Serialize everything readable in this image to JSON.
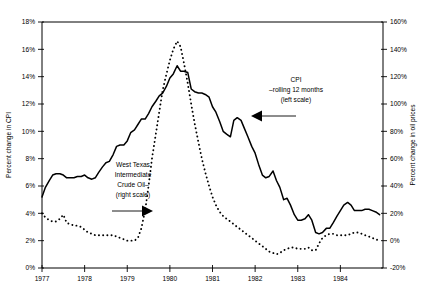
{
  "chart_data": {
    "type": "line",
    "title": "",
    "subtitle": "",
    "xlabel": "",
    "ylabel": "Percent change in CPI",
    "y2label": "Percent change in oil prices",
    "grid": false,
    "legend_position": "inline-annotations",
    "xlim": [
      1977,
      1985
    ],
    "x_tick_labels": [
      "1977",
      "1978",
      "1979",
      "1980",
      "1981",
      "1982",
      "1983",
      "1984"
    ],
    "x_ticks": [
      1977,
      1978,
      1979,
      1980,
      1981,
      1982,
      1983,
      1984
    ],
    "ylim": [
      0,
      18
    ],
    "y_tick_labels": [
      "0%",
      "2%",
      "4%",
      "6%",
      "8%",
      "10%",
      "12%",
      "14%",
      "16%",
      "18%"
    ],
    "y_ticks": [
      0,
      2,
      4,
      6,
      8,
      10,
      12,
      14,
      16,
      18
    ],
    "y2lim": [
      -20,
      160
    ],
    "y2_tick_labels": [
      "-20%",
      "0%",
      "20%",
      "40%",
      "60%",
      "80%",
      "100%",
      "120%",
      "140%",
      "160%"
    ],
    "y2_ticks": [
      -20,
      0,
      20,
      40,
      60,
      80,
      100,
      120,
      140,
      160
    ],
    "series": [
      {
        "name": "CPI - rolling 12 months",
        "axis": "left",
        "style": "solid",
        "x": [
          1977.0,
          1977.08,
          1977.17,
          1977.25,
          1977.33,
          1977.42,
          1977.5,
          1977.58,
          1977.67,
          1977.75,
          1977.83,
          1977.92,
          1978.0,
          1978.08,
          1978.17,
          1978.25,
          1978.33,
          1978.42,
          1978.5,
          1978.58,
          1978.67,
          1978.75,
          1978.83,
          1978.92,
          1979.0,
          1979.08,
          1979.17,
          1979.25,
          1979.33,
          1979.42,
          1979.5,
          1979.58,
          1979.67,
          1979.75,
          1979.83,
          1979.92,
          1980.0,
          1980.08,
          1980.17,
          1980.25,
          1980.33,
          1980.42,
          1980.5,
          1980.58,
          1980.67,
          1980.75,
          1980.83,
          1980.92,
          1981.0,
          1981.08,
          1981.17,
          1981.25,
          1981.33,
          1981.42,
          1981.5,
          1981.58,
          1981.67,
          1981.75,
          1981.83,
          1981.92,
          1982.0,
          1982.08,
          1982.17,
          1982.25,
          1982.33,
          1982.42,
          1982.5,
          1982.58,
          1982.67,
          1982.75,
          1982.83,
          1982.92,
          1983.0,
          1983.08,
          1983.17,
          1983.25,
          1983.33,
          1983.42,
          1983.5,
          1983.58,
          1983.67,
          1983.75,
          1983.83,
          1983.92,
          1984.0,
          1984.08,
          1984.17,
          1984.25,
          1984.33,
          1984.42,
          1984.5,
          1984.58,
          1984.67,
          1984.75,
          1984.83,
          1984.92
        ],
        "values": [
          5.2,
          5.9,
          6.4,
          6.8,
          6.9,
          6.9,
          6.8,
          6.6,
          6.6,
          6.6,
          6.7,
          6.7,
          6.8,
          6.6,
          6.5,
          6.6,
          7.0,
          7.4,
          7.7,
          7.8,
          8.3,
          8.9,
          9.0,
          9.0,
          9.3,
          9.9,
          10.1,
          10.5,
          10.9,
          10.9,
          11.3,
          11.8,
          12.2,
          12.6,
          12.8,
          13.3,
          13.9,
          14.2,
          14.8,
          14.4,
          14.4,
          14.3,
          13.1,
          12.9,
          12.8,
          12.8,
          12.7,
          12.5,
          11.8,
          11.4,
          10.7,
          10.0,
          9.8,
          9.6,
          10.8,
          11.0,
          10.8,
          10.2,
          9.6,
          8.9,
          8.4,
          7.6,
          6.8,
          6.6,
          6.7,
          7.1,
          6.4,
          5.9,
          5.0,
          5.1,
          4.6,
          3.9,
          3.5,
          3.5,
          3.6,
          3.9,
          3.5,
          2.6,
          2.5,
          2.6,
          2.9,
          2.9,
          3.3,
          3.8,
          4.2,
          4.6,
          4.8,
          4.6,
          4.2,
          4.2,
          4.2,
          4.3,
          4.3,
          4.2,
          4.1,
          3.9
        ]
      },
      {
        "name": "West Texas Intermediate Crude Oil",
        "axis": "right",
        "style": "dotted",
        "x": [
          1977.0,
          1977.08,
          1977.17,
          1977.25,
          1977.33,
          1977.42,
          1977.5,
          1977.58,
          1977.67,
          1977.75,
          1977.83,
          1977.92,
          1978.0,
          1978.08,
          1978.17,
          1978.25,
          1978.33,
          1978.42,
          1978.5,
          1978.58,
          1978.67,
          1978.75,
          1978.83,
          1978.92,
          1979.0,
          1979.08,
          1979.17,
          1979.25,
          1979.33,
          1979.42,
          1979.5,
          1979.58,
          1979.67,
          1979.75,
          1979.83,
          1979.92,
          1980.0,
          1980.08,
          1980.17,
          1980.25,
          1980.33,
          1980.42,
          1980.5,
          1980.58,
          1980.67,
          1980.75,
          1980.83,
          1980.92,
          1981.0,
          1981.08,
          1981.17,
          1981.25,
          1981.33,
          1981.42,
          1981.5,
          1981.58,
          1981.67,
          1981.75,
          1981.83,
          1981.92,
          1982.0,
          1982.08,
          1982.17,
          1982.25,
          1982.33,
          1982.42,
          1982.5,
          1982.58,
          1982.67,
          1982.75,
          1982.83,
          1982.92,
          1983.0,
          1983.08,
          1983.17,
          1983.25,
          1983.33,
          1983.42,
          1983.5,
          1983.58,
          1983.67,
          1983.75,
          1983.83,
          1983.92,
          1984.0,
          1984.08,
          1984.17,
          1984.25,
          1984.33,
          1984.42,
          1984.5,
          1984.58,
          1984.67,
          1984.75,
          1984.83,
          1984.92
        ],
        "values": [
          20,
          17,
          15,
          14,
          14,
          16,
          19,
          13,
          12,
          11,
          11,
          10,
          8,
          6,
          5,
          4,
          4,
          4,
          4,
          4,
          4,
          3,
          2,
          1,
          0,
          0,
          0,
          2,
          9,
          22,
          40,
          60,
          78,
          94,
          110,
          122,
          132,
          140,
          146,
          142,
          130,
          115,
          100,
          86,
          72,
          60,
          50,
          40,
          32,
          26,
          21,
          18,
          16,
          14,
          12,
          10,
          8,
          6,
          4,
          2,
          0,
          -2,
          -4,
          -6,
          -8,
          -9,
          -10,
          -9,
          -7,
          -6,
          -5,
          -5,
          -6,
          -6,
          -6,
          -5,
          -7,
          -7,
          -2,
          2,
          4,
          5,
          5,
          4,
          4,
          4,
          4,
          5,
          6,
          6,
          5,
          4,
          3,
          2,
          1,
          0
        ]
      }
    ],
    "annotations": [
      {
        "id": "oil-annotation",
        "lines": [
          "West Texas",
          "Intermediate",
          "Crude Oil–",
          "(right  scale)"
        ],
        "arrow_direction": "right"
      },
      {
        "id": "cpi-annotation",
        "lines": [
          "CPI",
          "–rolling 12 months",
          "(left  scale)"
        ],
        "arrow_direction": "left"
      }
    ]
  },
  "colors": {
    "background": "#ffffff",
    "ink": "#000000"
  }
}
